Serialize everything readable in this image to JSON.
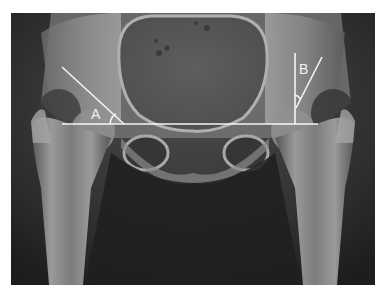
{
  "image": {
    "subject": "AP pelvis radiograph with hip angle annotations",
    "frame": {
      "x": 11,
      "y": 13,
      "width": 364,
      "height": 272
    },
    "colors": {
      "page_background": "#ffffff",
      "film_dark": "#1e1e1e",
      "soft_tissue": "#3a3a3a",
      "bone": "#9a9a9a",
      "bone_bright": "#c4c4c4",
      "annotation": "#f4f4f4"
    }
  },
  "annotations": {
    "baseline": {
      "x1": 62,
      "y1": 124,
      "x2": 318,
      "y2": 124
    },
    "angle_a": {
      "label": "A",
      "line": {
        "x1": 62,
        "y1": 67,
        "x2": 124,
        "y2": 124
      },
      "label_pos": {
        "x": 91,
        "y": 107
      }
    },
    "angle_b": {
      "label": "B",
      "vertical": {
        "x1": 295,
        "y1": 53,
        "x2": 295,
        "y2": 124
      },
      "line": {
        "x1": 322,
        "y1": 57,
        "x2": 296,
        "y2": 108
      },
      "label_pos": {
        "x": 299,
        "y": 62
      }
    }
  }
}
